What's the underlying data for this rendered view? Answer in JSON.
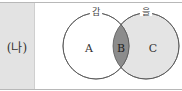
{
  "row": {
    "label": "(나)"
  },
  "venn": {
    "sets": [
      {
        "name": "갑",
        "region_label": "A"
      },
      {
        "name": "을",
        "region_label": "C"
      }
    ],
    "intersection_label": "B",
    "colors": {
      "left_fill": "#ffffff",
      "right_fill": "#e4e4e4",
      "intersection_fill": "#8c8c8c",
      "stroke": "#555555"
    }
  }
}
